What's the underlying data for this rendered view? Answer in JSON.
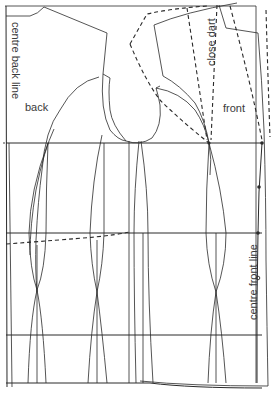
{
  "diagram": {
    "labels": {
      "centre_back": "centre back line",
      "back": "back",
      "close_dart": "close dart",
      "front": "front",
      "centre_front": "centre front line"
    },
    "line_color": "#2a2a2a",
    "background": "#ffffff",
    "guides": {
      "horizontal_lines_y": [
        8,
        143,
        233,
        333,
        387
      ],
      "names": [
        "neck line",
        "chest line",
        "waist line",
        "hip line",
        "hem line"
      ]
    },
    "panels": [
      "back",
      "side back",
      "side front",
      "front"
    ],
    "markers": {
      "dots_on_centre_front": 4,
      "dots_at_chest_line": 2
    }
  }
}
